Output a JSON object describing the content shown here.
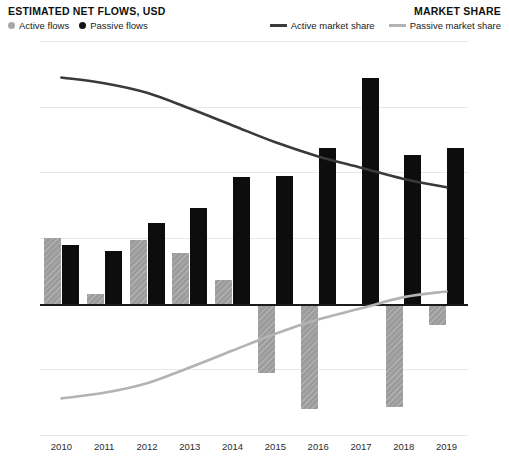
{
  "header": {
    "left_title": "ESTIMATED NET FLOWS, USD",
    "right_title": "MARKET SHARE"
  },
  "legend": {
    "left": [
      {
        "label": "Active flows",
        "marker": "circle-gray-icon",
        "color": "#a8a8a8"
      },
      {
        "label": "Passive flows",
        "marker": "circle-black-icon",
        "color": "#141414"
      }
    ],
    "right": [
      {
        "label": "Active market share",
        "marker": "line-dark-icon",
        "color": "#3a3a3a"
      },
      {
        "label": "Passive market share",
        "marker": "line-light-icon",
        "color": "#b3b3b3"
      }
    ]
  },
  "chart_data": {
    "type": "bar",
    "title": "ESTIMATED NET FLOWS, USD",
    "subtitle": "MARKET SHARE",
    "xlabel": "",
    "ylabel": "Estimated net flows, USD",
    "y2label": "Market share",
    "grid": true,
    "legend_position": "top",
    "categories": [
      "2010",
      "2011",
      "2012",
      "2013",
      "2014",
      "2015",
      "2016",
      "2017",
      "2018",
      "2019"
    ],
    "ylim": [
      -400,
      800
    ],
    "yticks": [
      800,
      600,
      400,
      200,
      0,
      -200,
      -400
    ],
    "ytick_labels": [
      "$800B",
      "$600B",
      "$400B",
      "$200B",
      "$0",
      "-$200B",
      "-$400B"
    ],
    "y2lim": [
      15,
      85
    ],
    "y2ticks": [
      85,
      75,
      65,
      55,
      45,
      35,
      25,
      15
    ],
    "y2tick_labels": [
      "85%",
      "75%",
      "65%",
      "55%",
      "45%",
      "35%",
      "25%",
      "15%"
    ],
    "series": [
      {
        "name": "Active flows",
        "kind": "bar",
        "color": "#9c9c9c",
        "axis": "left",
        "unit": "USD billions",
        "values": [
          200,
          30,
          195,
          155,
          72,
          -210,
          -320,
          0,
          -315,
          -65
        ]
      },
      {
        "name": "Passive flows",
        "kind": "bar",
        "color": "#0d0d0d",
        "axis": "left",
        "unit": "USD billions",
        "values": [
          180,
          160,
          245,
          290,
          385,
          390,
          473,
          688,
          452,
          473
        ]
      },
      {
        "name": "Active market share",
        "kind": "line",
        "color": "#3a3a3a",
        "axis": "right",
        "unit": "percent",
        "values": [
          78.5,
          77.5,
          75.8,
          73.0,
          70.0,
          67.0,
          64.5,
          62.5,
          60.5,
          59.0
        ]
      },
      {
        "name": "Passive market share",
        "kind": "line",
        "color": "#b3b3b3",
        "axis": "right",
        "unit": "percent",
        "values": [
          21.5,
          22.5,
          24.2,
          27.0,
          30.0,
          33.0,
          35.5,
          37.5,
          39.5,
          40.5
        ]
      }
    ]
  }
}
